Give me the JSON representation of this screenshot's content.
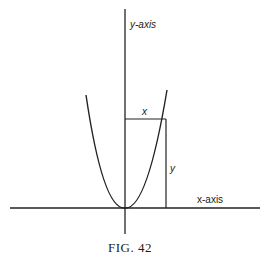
{
  "figure": {
    "caption": "Fig. 42",
    "caption_display": "FIG. 42",
    "labels": {
      "y_axis": "y-axis",
      "x_axis": "x-axis",
      "x_segment": "x",
      "y_segment": "y"
    },
    "curve": "parabola y = kx^2 with vertex at origin",
    "colors": {
      "ink": "#222222",
      "background": "#ffffff"
    }
  }
}
